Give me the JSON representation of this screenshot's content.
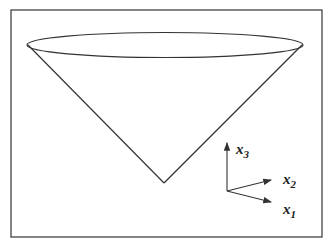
{
  "figure": {
    "stroke_color": "#333333",
    "background": "#ffffff"
  },
  "axes": {
    "x1": {
      "base": "x",
      "sub": "1"
    },
    "x2": {
      "base": "x",
      "sub": "2"
    },
    "x3": {
      "base": "x",
      "sub": "3"
    }
  }
}
